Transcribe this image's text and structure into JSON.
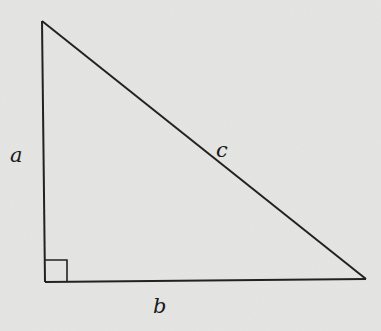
{
  "diagram": {
    "type": "right-triangle",
    "background": "#e6e6e4",
    "stroke": "#222222",
    "vertices": {
      "top": [
        42,
        21
      ],
      "right_angle": [
        45,
        282
      ],
      "right": [
        366,
        279
      ]
    },
    "right_angle_marker": true,
    "labels": {
      "a": "a",
      "b": "b",
      "c": "c"
    }
  }
}
